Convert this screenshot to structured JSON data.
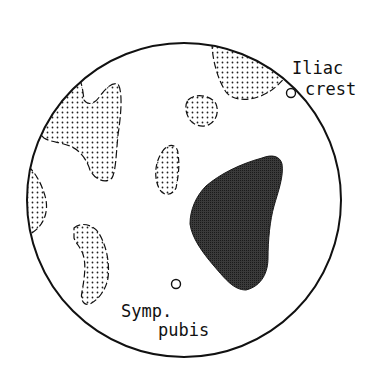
{
  "diagram": {
    "type": "anatomical-region-map",
    "boundary": "circle",
    "colors": {
      "outline": "#111111",
      "stipple_fill": "#ffffff",
      "stipple_dot": "#222222",
      "dark_region": "#2b2b2b"
    },
    "regions": [
      {
        "id": "upper-right-stippled",
        "style": "stippled"
      },
      {
        "id": "upper-left-stippled",
        "style": "stippled"
      },
      {
        "id": "upper-center-stippled",
        "style": "stippled"
      },
      {
        "id": "center-stippled",
        "style": "stippled"
      },
      {
        "id": "left-edge-stippled",
        "style": "stippled"
      },
      {
        "id": "lower-left-stippled",
        "style": "stippled"
      },
      {
        "id": "lower-right-dark",
        "style": "dark"
      }
    ],
    "landmarks": [
      {
        "id": "iliac-crest",
        "label_line1": "Iliac",
        "label_line2": "crest"
      },
      {
        "id": "symphysis-pubis",
        "label_line1": "Symp.",
        "label_line2": "pubis"
      }
    ]
  }
}
